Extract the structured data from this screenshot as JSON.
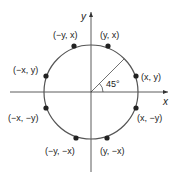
{
  "diagram": {
    "axes": {
      "x_label": "x",
      "y_label": "y"
    },
    "angle_label": "45°",
    "points": [
      {
        "label": "(y, x)"
      },
      {
        "label": "(−y, x)"
      },
      {
        "label": "(−x, y)"
      },
      {
        "label": "(x, y)"
      },
      {
        "label": "(−x, −y)"
      },
      {
        "label": "(x, −y)"
      },
      {
        "label": "(−y, −x)"
      },
      {
        "label": "(y, −x)"
      }
    ],
    "colors": {
      "line": "#555555",
      "point": "#222222"
    }
  }
}
